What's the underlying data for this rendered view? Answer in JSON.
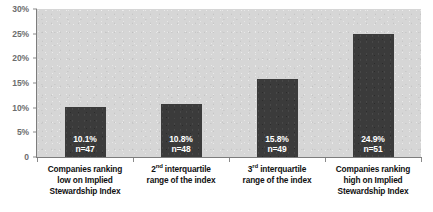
{
  "chart_data": {
    "type": "bar",
    "title": "",
    "xlabel": "",
    "ylabel": "",
    "categories": [
      "Companies ranking low on Implied Stewardship Index",
      "2nd interquartile range of the index",
      "3rd interquartile range of the index",
      "Companies ranking high on Implied Stewardship Index"
    ],
    "category_lines": [
      [
        "Companies ranking",
        "low on Implied",
        "Stewardship Index"
      ],
      [
        "2|nd| interquartile",
        "range of the index"
      ],
      [
        "3|rd| interquartile",
        "range of the index"
      ],
      [
        "Companies ranking",
        "high on Implied",
        "Stewardship Index"
      ]
    ],
    "values": [
      10.1,
      10.8,
      15.8,
      24.9
    ],
    "value_labels": [
      "10.1%",
      "10.8%",
      "15.8%",
      "24.9%"
    ],
    "n_labels": [
      "n=47",
      "n=48",
      "n=49",
      "n=51"
    ],
    "n_values": [
      47,
      48,
      49,
      51
    ],
    "ylim": [
      0,
      30
    ],
    "ytick_values": [
      0,
      5,
      10,
      15,
      20,
      25,
      30
    ],
    "ytick_labels": [
      "0",
      "5%",
      "10%",
      "15%",
      "20%",
      "25%",
      "30%"
    ],
    "grid": false,
    "legend": false,
    "legend_position": "none",
    "colors": {
      "bar": "#3b3b3b",
      "plot_background": "#d6d6d6",
      "figure_background": "#ffffff",
      "axis_line": "#7d7d7d",
      "ytick_label": "#6d6d6d",
      "category_label": "#111111",
      "bar_label": "#ffffff"
    }
  }
}
